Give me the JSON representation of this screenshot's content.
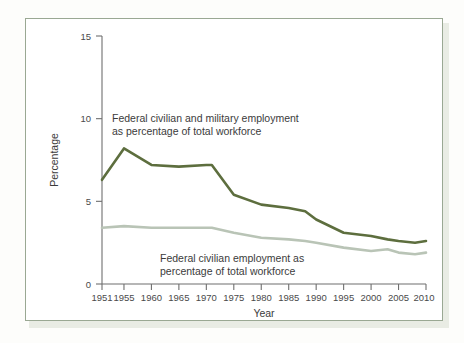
{
  "figure": {
    "frame_color": "#9aa893",
    "background": "#ffffff"
  },
  "chart_data": {
    "type": "line",
    "title": "",
    "xlabel": "Year",
    "ylabel": "Percentage",
    "xlim": [
      1951,
      2010
    ],
    "ylim": [
      0,
      15
    ],
    "yticks": [
      0,
      5,
      10,
      15
    ],
    "ytick_labels": [
      "0",
      "5",
      "10",
      "15"
    ],
    "xticks": [
      1951,
      1955,
      1960,
      1965,
      1970,
      1975,
      1980,
      1985,
      1990,
      1995,
      2000,
      2005,
      2010
    ],
    "xtick_labels": [
      "1951",
      "1955",
      "1960",
      "1965",
      "1970",
      "1975",
      "1980",
      "1985",
      "1990",
      "1995",
      "2000",
      "2005",
      "2010"
    ],
    "grid": false,
    "legend": "annotations",
    "x": [
      1951,
      1955,
      1960,
      1965,
      1970,
      1971,
      1975,
      1980,
      1985,
      1988,
      1990,
      1995,
      2000,
      2003,
      2005,
      2008,
      2010
    ],
    "series": [
      {
        "name": "Federal civilian and military employment as percentage of total workforce",
        "color": "#5d6e3e",
        "values": [
          6.3,
          8.2,
          7.2,
          7.1,
          7.2,
          7.2,
          5.4,
          4.8,
          4.6,
          4.4,
          3.9,
          3.1,
          2.9,
          2.7,
          2.6,
          2.5,
          2.6
        ]
      },
      {
        "name": "Federal civilian employment as percentage of total workforce",
        "color": "#b9c4b6",
        "values": [
          3.4,
          3.5,
          3.4,
          3.4,
          3.4,
          3.4,
          3.1,
          2.8,
          2.7,
          2.6,
          2.5,
          2.2,
          2.0,
          2.1,
          1.9,
          1.8,
          1.9
        ]
      }
    ],
    "annotations": [
      {
        "id": "annotation-total-employment",
        "lines": [
          "Federal civilian and military employment",
          "as percentage of total workforce"
        ],
        "series": "Federal civilian and military employment as percentage of total workforce"
      },
      {
        "id": "annotation-civilian-employment",
        "lines": [
          "Federal civilian employment as",
          "percentage of total workforce"
        ],
        "series": "Federal civilian employment as percentage of total workforce"
      }
    ]
  }
}
